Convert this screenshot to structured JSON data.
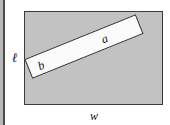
{
  "figure": {
    "name": "rectangular-board-with-diagonal-cut-piece",
    "outer_shape": {
      "name": "board-face",
      "kind": "rectangle",
      "fill_color": "#c2c2c2",
      "stroke_color": "#3a3a3a",
      "width_label": "w",
      "height_label": "ℓ"
    },
    "inner_shape": {
      "name": "cut-bar",
      "kind": "rotated-rectangle",
      "fill_color": "#fbfbfb",
      "stroke_color": "#2e2e2e",
      "rotation_degrees": -22,
      "long_side_label": "a",
      "short_side_label": "b"
    },
    "labels": {
      "height": "ℓ",
      "width": "w",
      "bar_length": "a",
      "bar_width": "b"
    },
    "page": {
      "gutter_rule_color": "#4a4a4a",
      "background_color": "#ffffff"
    }
  }
}
